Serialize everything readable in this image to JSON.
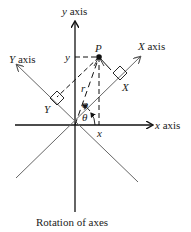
{
  "diagram": {
    "caption": "Rotation of axes",
    "labels": {
      "y_axis": "y axis",
      "x_axis": "x axis",
      "X_axis": "X axis",
      "Y_axis": "Y axis",
      "point": "P",
      "y_coord": "y",
      "x_coord": "x",
      "X_coord": "X",
      "Y_coord": "Y",
      "r": "r",
      "phi": "φ",
      "theta": "θ"
    },
    "colors": {
      "axis": "#222222",
      "rotated_axis": "#666666",
      "background": "#ffffff"
    }
  }
}
